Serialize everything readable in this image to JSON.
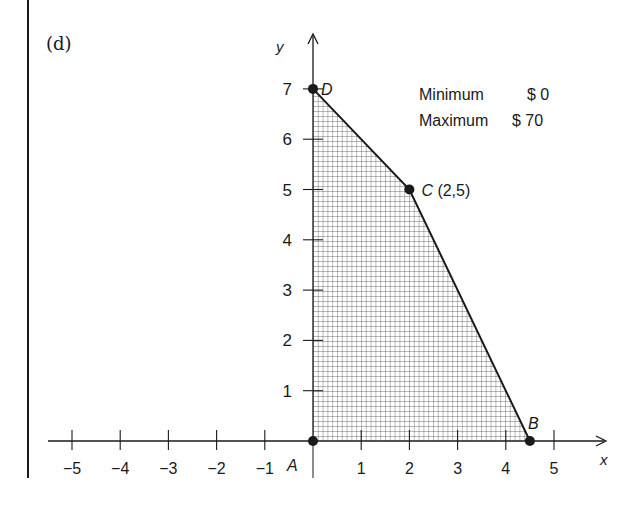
{
  "panel_label": "(d)",
  "legend": {
    "min_label": "Minimum",
    "min_value": "$ 0",
    "max_label": "Maximum",
    "max_value": "$ 70"
  },
  "colors": {
    "ink": "#1a1a1a",
    "hatch": "#3a3a3a",
    "background": "#ffffff"
  },
  "chart_data": {
    "type": "area",
    "title": "(d)",
    "xlabel": "x",
    "ylabel": "y",
    "xlim": [
      -5.5,
      6.2
    ],
    "ylim": [
      0,
      8.2
    ],
    "grid": false,
    "x_ticks": [
      -5,
      -4,
      -3,
      -2,
      -1,
      1,
      2,
      3,
      4,
      5
    ],
    "x_tick_labels": [
      "−5",
      "−4",
      "−3",
      "−2",
      "−1",
      "1",
      "2",
      "3",
      "4",
      "5"
    ],
    "y_ticks": [
      1,
      2,
      3,
      4,
      5,
      6,
      7
    ],
    "y_tick_labels": [
      "1",
      "2",
      "3",
      "4",
      "5",
      "6",
      "7"
    ],
    "feasible_region": {
      "fill": "crosshatch",
      "vertices": [
        {
          "label": "A",
          "x": 0,
          "y": 0
        },
        {
          "label": "B",
          "x": 4.5,
          "y": 0
        },
        {
          "label": "C",
          "x": 2,
          "y": 5
        },
        {
          "label": "D",
          "x": 0,
          "y": 7
        }
      ]
    },
    "points": [
      {
        "label": "A",
        "x": 0,
        "y": 0,
        "annotation": ""
      },
      {
        "label": "B",
        "x": 4.5,
        "y": 0,
        "annotation": ""
      },
      {
        "label": "C",
        "x": 2,
        "y": 5,
        "annotation": "(2,5)"
      },
      {
        "label": "D",
        "x": 0,
        "y": 7,
        "annotation": ""
      }
    ],
    "annotations": [
      {
        "text": "Minimum $ 0"
      },
      {
        "text": "Maximum $ 70"
      }
    ],
    "legend_position": "upper right"
  }
}
